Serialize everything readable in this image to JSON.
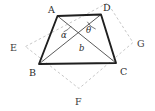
{
  "figure": {
    "colors": {
      "background": "#ffffff",
      "quad_stroke": "#1f1f1f",
      "diagonal_stroke": "#3d3d3d",
      "dashed_stroke": "#b9b9b9",
      "label_color": "#2b2b2b"
    },
    "stroke_widths": {
      "quad": 1.9,
      "diagonal": 0.85,
      "dashed": 0.8
    },
    "dash_pattern": "2.6,2.4"
  },
  "points": {
    "A": {
      "label": "A",
      "x": 57.5,
      "y": 16.0,
      "label_x": 48.0,
      "label_y": 12.5
    },
    "B": {
      "label": "B",
      "x": 39.0,
      "y": 64.0,
      "label_x": 29.0,
      "label_y": 75.5
    },
    "C": {
      "label": "C",
      "x": 116.0,
      "y": 63.0,
      "label_x": 120.0,
      "label_y": 75.0
    },
    "D": {
      "label": "D",
      "x": 101.0,
      "y": 14.5,
      "label_x": 103.0,
      "label_y": 11.0
    },
    "E": {
      "label": "E",
      "x": 25.5,
      "y": 46.5,
      "label_x": 10.0,
      "label_y": 50.5
    },
    "F": {
      "label": "F",
      "x": 79.0,
      "y": 88.5,
      "label_x": 75.0,
      "label_y": 105.0
    },
    "G": {
      "label": "G",
      "x": 133.0,
      "y": 42.5,
      "label_x": 137.0,
      "label_y": 46.5
    },
    "H": {
      "label": "",
      "x": 107.5,
      "y": 3.0,
      "label_x": 0,
      "label_y": 0
    }
  },
  "quadrilateral": {
    "name": "ABCD",
    "vertex_order": [
      "A",
      "D",
      "C",
      "B"
    ]
  },
  "diagonals": [
    {
      "name": "AC",
      "from": "A",
      "to": "C"
    },
    {
      "name": "BD",
      "from": "B",
      "to": "D"
    }
  ],
  "dashed_square": {
    "name": "EFGH",
    "vertex_order": [
      "E",
      "H",
      "G",
      "F"
    ]
  },
  "angle_arcs": [
    {
      "name": "alpha-arc",
      "cx": 57.5,
      "cy": 16.0,
      "r": 17.0,
      "from_deg": 69.0,
      "to_deg": 37.0
    },
    {
      "name": "theta-arc",
      "cx": 101.0,
      "cy": 14.5,
      "r": 15.5,
      "from_deg": 152.0,
      "to_deg": 110.0
    }
  ],
  "annotations": [
    {
      "name": "alpha-label",
      "text": "α",
      "x": 61.0,
      "y": 38.0
    },
    {
      "name": "theta-label",
      "text": "θ",
      "x": 86.0,
      "y": 32.5
    },
    {
      "name": "b-label",
      "text": "b",
      "x": 79.0,
      "y": 50.5
    }
  ]
}
